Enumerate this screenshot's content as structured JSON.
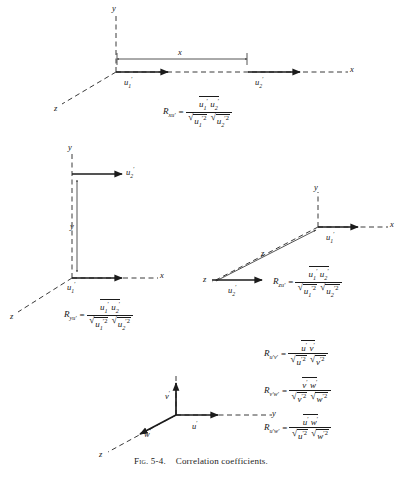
{
  "figure": {
    "caption_prefix": "Fig. 5-4.",
    "caption_text": "Correlation coefficients.",
    "number": "5-4",
    "title": "Correlation coefficients"
  },
  "colors": {
    "ink": "#1b1b1b",
    "background": "#ffffff",
    "dashed_axis": "#3a3a3a"
  },
  "diagrams": [
    {
      "id": "longitudinal-separation-x",
      "position": "top",
      "axes": [
        {
          "name": "y-axis",
          "label": "y",
          "style": "dashed",
          "direction": "up"
        },
        {
          "name": "x-axis",
          "label": "x",
          "style": "dashed",
          "direction": "right"
        },
        {
          "name": "z-axis",
          "label": "z",
          "style": "dashed",
          "direction": "down-left"
        }
      ],
      "vectors": [
        {
          "name": "u1-prime-vector",
          "label_base": "u",
          "label_sub": "1",
          "label_prime": "′",
          "direction": "right"
        },
        {
          "name": "u2-prime-vector",
          "label_base": "u",
          "label_sub": "2",
          "label_prime": "′",
          "direction": "right"
        }
      ],
      "separation": {
        "name": "x-separation-dimension",
        "label": "x"
      },
      "formula": {
        "lhs_R": "R",
        "lhs_sub": "xu′",
        "equals": "=",
        "numerator": "u′₁ u′₂",
        "numerator_parts": [
          {
            "base": "u",
            "sub": "1",
            "prime": "′"
          },
          {
            "base": "u",
            "sub": "2",
            "prime": "′"
          }
        ],
        "denominator_parts": [
          {
            "base": "u",
            "sub": "1",
            "prime": "′",
            "exp": "2"
          },
          {
            "base": "u",
            "sub": "2",
            "prime": "′",
            "exp": "2"
          }
        ],
        "plain": "R_xu' = (u'_1 u'_2)bar / ( sqrt( (u'_1)^2 bar ) sqrt( (u'_2)^2 bar ) )"
      }
    },
    {
      "id": "lateral-separation-y",
      "position": "middle-left",
      "axes": [
        {
          "name": "y-axis",
          "label": "y",
          "style": "dashed",
          "direction": "up"
        },
        {
          "name": "x-axis",
          "label": "x",
          "style": "dashed",
          "direction": "right"
        },
        {
          "name": "z-axis",
          "label": "z",
          "style": "dashed",
          "direction": "down-left"
        }
      ],
      "vectors": [
        {
          "name": "u1-prime-vector",
          "label_base": "u",
          "label_sub": "1",
          "label_prime": "′",
          "direction": "right"
        },
        {
          "name": "u2-prime-vector",
          "label_base": "u",
          "label_sub": "2",
          "label_prime": "′",
          "direction": "right"
        }
      ],
      "separation": {
        "name": "y-separation-dimension",
        "label": "y"
      },
      "formula": {
        "lhs_R": "R",
        "lhs_sub": "yu′",
        "equals": "=",
        "numerator_parts": [
          {
            "base": "u",
            "sub": "1",
            "prime": "′"
          },
          {
            "base": "u",
            "sub": "2",
            "prime": "′"
          }
        ],
        "denominator_parts": [
          {
            "base": "u",
            "sub": "1",
            "prime": "′",
            "exp": "2"
          },
          {
            "base": "u",
            "sub": "2",
            "prime": "′",
            "exp": "2"
          }
        ],
        "plain": "R_yu' = (u'_1 u'_2)bar / ( sqrt( (u'_1)^2 bar ) sqrt( (u'_2)^2 bar ) )"
      }
    },
    {
      "id": "lateral-separation-z",
      "position": "middle-right",
      "axes": [
        {
          "name": "y-axis",
          "label": "y",
          "style": "dashed",
          "direction": "up"
        },
        {
          "name": "x-axis",
          "label": "x",
          "style": "dashed",
          "direction": "right"
        },
        {
          "name": "z-axis",
          "label": "z",
          "style": "dashed",
          "direction": "down-left"
        }
      ],
      "vectors": [
        {
          "name": "u1-prime-vector",
          "label_base": "u",
          "label_sub": "1",
          "label_prime": "′",
          "direction": "right"
        },
        {
          "name": "u2-prime-vector",
          "label_base": "u",
          "label_sub": "2",
          "label_prime": "′",
          "direction": "right"
        }
      ],
      "separation": {
        "name": "z-separation-dimension",
        "label": "z"
      },
      "formula": {
        "lhs_R": "R",
        "lhs_sub": "zu′",
        "equals": "=",
        "numerator_parts": [
          {
            "base": "u",
            "sub": "1",
            "prime": "′"
          },
          {
            "base": "u",
            "sub": "2",
            "prime": "′"
          }
        ],
        "denominator_parts": [
          {
            "base": "u",
            "sub": "1",
            "prime": "′",
            "exp": "2"
          },
          {
            "base": "u",
            "sub": "2",
            "prime": "′",
            "exp": "2"
          }
        ],
        "plain": "R_zu' = (u'_1 u'_2)bar / ( sqrt( (u'_1)^2 bar ) sqrt( (u'_2)^2 bar ) )"
      }
    },
    {
      "id": "single-point-components",
      "position": "bottom-center",
      "axes": [
        {
          "name": "vertical-axis",
          "label": "",
          "style": "dashed",
          "direction": "up"
        },
        {
          "name": "y-axis",
          "label": "y",
          "style": "dashed",
          "direction": "right"
        },
        {
          "name": "z-axis",
          "label": "z",
          "style": "dashed",
          "direction": "down-left"
        }
      ],
      "vectors": [
        {
          "name": "v-prime-vector",
          "label_base": "v",
          "label_prime": "′",
          "direction": "up"
        },
        {
          "name": "u-prime-vector",
          "label_base": "u",
          "label_prime": "′",
          "direction": "right"
        },
        {
          "name": "w-prime-vector",
          "label_base": "w",
          "label_prime": "′",
          "direction": "down-left"
        }
      ]
    }
  ],
  "formulas_block": {
    "position": "bottom-right",
    "items": [
      {
        "id": "R-uv",
        "lhs_R": "R",
        "lhs_sub": "u′v′",
        "equals": "=",
        "numerator_parts": [
          {
            "base": "u",
            "prime": "′"
          },
          {
            "base": "v",
            "prime": "′"
          }
        ],
        "denominator_parts": [
          {
            "base": "u",
            "prime": "′",
            "exp": "2"
          },
          {
            "base": "v",
            "prime": "′",
            "exp": "2"
          }
        ],
        "plain": "R_u'v' = (u'v')bar / ( sqrt( u'^2 bar ) sqrt( v'^2 bar ) )"
      },
      {
        "id": "R-vw",
        "lhs_R": "R",
        "lhs_sub": "v′w′",
        "equals": "=",
        "numerator_parts": [
          {
            "base": "v",
            "prime": "′"
          },
          {
            "base": "w",
            "prime": "′"
          }
        ],
        "denominator_parts": [
          {
            "base": "v",
            "prime": "′",
            "exp": "2"
          },
          {
            "base": "w",
            "prime": "′",
            "exp": "2"
          }
        ],
        "plain": "R_v'w' = (v'w')bar / ( sqrt( v'^2 bar ) sqrt( w'^2 bar ) )"
      },
      {
        "id": "R-uw",
        "lhs_R": "R",
        "lhs_sub": "u′w′",
        "equals": "=",
        "numerator_parts": [
          {
            "base": "u",
            "prime": "′"
          },
          {
            "base": "w",
            "prime": "′"
          }
        ],
        "denominator_parts": [
          {
            "base": "u",
            "prime": "′",
            "exp": "2"
          },
          {
            "base": "w",
            "prime": "′",
            "exp": "2"
          }
        ],
        "plain": "R_u'w' = (u'w')bar / ( sqrt( u'^2 bar ) sqrt( w'^2 bar ) )"
      }
    ]
  },
  "labels": {
    "x": "x",
    "y": "y",
    "z": "z",
    "u": "u",
    "v": "v",
    "w": "w",
    "prime": "′",
    "one": "1",
    "two": "2",
    "exp2": "2",
    "equals": "=",
    "R": "R"
  }
}
